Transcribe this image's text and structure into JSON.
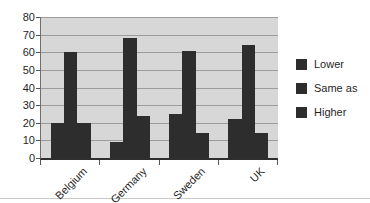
{
  "chart_data": {
    "type": "bar",
    "title": "",
    "xlabel": "",
    "ylabel": "",
    "categories": [
      "Belgium",
      "Germany",
      "Sweden",
      "UK"
    ],
    "series": [
      {
        "name": "Lower",
        "color": "#2d2d2d",
        "values": [
          20,
          9,
          25,
          22
        ]
      },
      {
        "name": "Same as",
        "color": "#2d2d2d",
        "values": [
          60,
          68,
          61,
          64
        ]
      },
      {
        "name": "Higher",
        "color": "#2d2d2d",
        "values": [
          20,
          24,
          14,
          14
        ]
      }
    ],
    "ylim": [
      0,
      80
    ],
    "yticks": [
      0,
      10,
      20,
      30,
      40,
      50,
      60,
      70,
      80
    ],
    "grid": true,
    "legend_position": "right",
    "plot_background": "#d7d7d7",
    "gridline_color": "#9c9c9c",
    "axis_color": "#2f2f2f",
    "text_color": "#1f1f1f"
  }
}
